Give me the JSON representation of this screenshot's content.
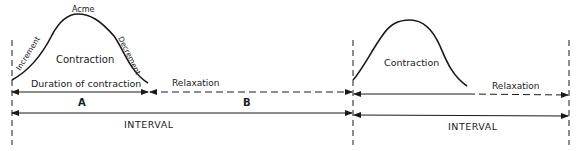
{
  "diagram": {
    "first_cycle": {
      "peak_label": "Acme",
      "rise_label": "Increment",
      "fall_label": "Decrement",
      "contraction_label": "Contraction",
      "duration_label": "Duration of contraction",
      "relaxation_label": "Relaxation",
      "segment_a_label": "A",
      "segment_b_label": "B",
      "interval_label": "INTERVAL"
    },
    "second_cycle": {
      "contraction_label": "Contraction",
      "relaxation_label": "Relaxation",
      "interval_label": "INTERVAL"
    },
    "colors": {
      "ink": "#1a1a1a",
      "background": "#ffffff"
    }
  }
}
